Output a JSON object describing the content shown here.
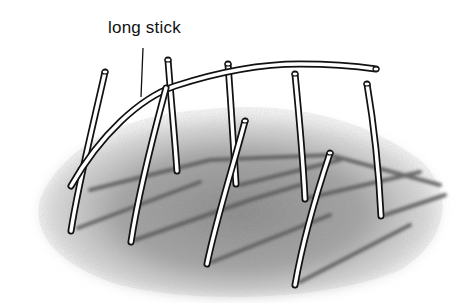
{
  "illustration": {
    "label": "long stick",
    "description": "Sticks pushed into the ground with one long stick bent into an arc across them",
    "colors": {
      "ink": "#111111",
      "stick_fill": "#ffffff",
      "ground_shadow": "#8a8a8a",
      "background": "#ffffff"
    }
  }
}
